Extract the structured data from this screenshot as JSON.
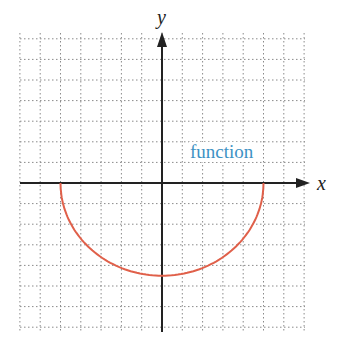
{
  "chart_data": {
    "type": "line",
    "title": "",
    "xlabel": "x",
    "ylabel": "y",
    "annotation": "function",
    "grid": true,
    "xlim": [
      -7,
      7
    ],
    "ylim": [
      -7.5,
      7
    ],
    "grid_step": 1,
    "series": [
      {
        "name": "function",
        "color": "#e0604a",
        "description": "lower half of an ellipse/circle from (-5,0) to (5,0), minimum near (0,-4.5)",
        "x": [
          -5,
          -4,
          -3,
          -2,
          -1,
          0,
          1,
          2,
          3,
          4,
          5
        ],
        "y": [
          0,
          -2.7,
          -3.6,
          -4.1,
          -4.4,
          -4.5,
          -4.4,
          -4.1,
          -3.6,
          -2.7,
          0
        ]
      }
    ]
  },
  "labels": {
    "x_axis": "x",
    "y_axis": "y",
    "curve": "function"
  },
  "colors": {
    "curve": "#e0604a",
    "label": "#3d92c4",
    "axis": "#222222",
    "grid": "#8a8a8a"
  }
}
